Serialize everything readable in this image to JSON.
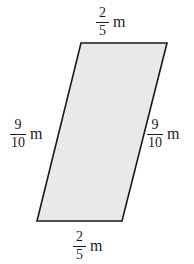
{
  "figure": {
    "kind": "parallelogram",
    "unit": "m",
    "fill_color": "#e9e9e9",
    "stroke_color": "#1a1a1a",
    "background_color": "#ffffff",
    "vertices": {
      "top_left": [
        81,
        43
      ],
      "top_right": [
        167,
        43
      ],
      "bottom_right": [
        122,
        221
      ],
      "bottom_left": [
        37,
        221
      ]
    },
    "labels": {
      "top": {
        "numerator": "2",
        "denominator": "5",
        "unit": "m"
      },
      "left": {
        "numerator": "9",
        "denominator": "10",
        "unit": "m"
      },
      "right": {
        "numerator": "9",
        "denominator": "10",
        "unit": "m"
      },
      "bottom": {
        "numerator": "2",
        "denominator": "5",
        "unit": "m"
      }
    }
  }
}
